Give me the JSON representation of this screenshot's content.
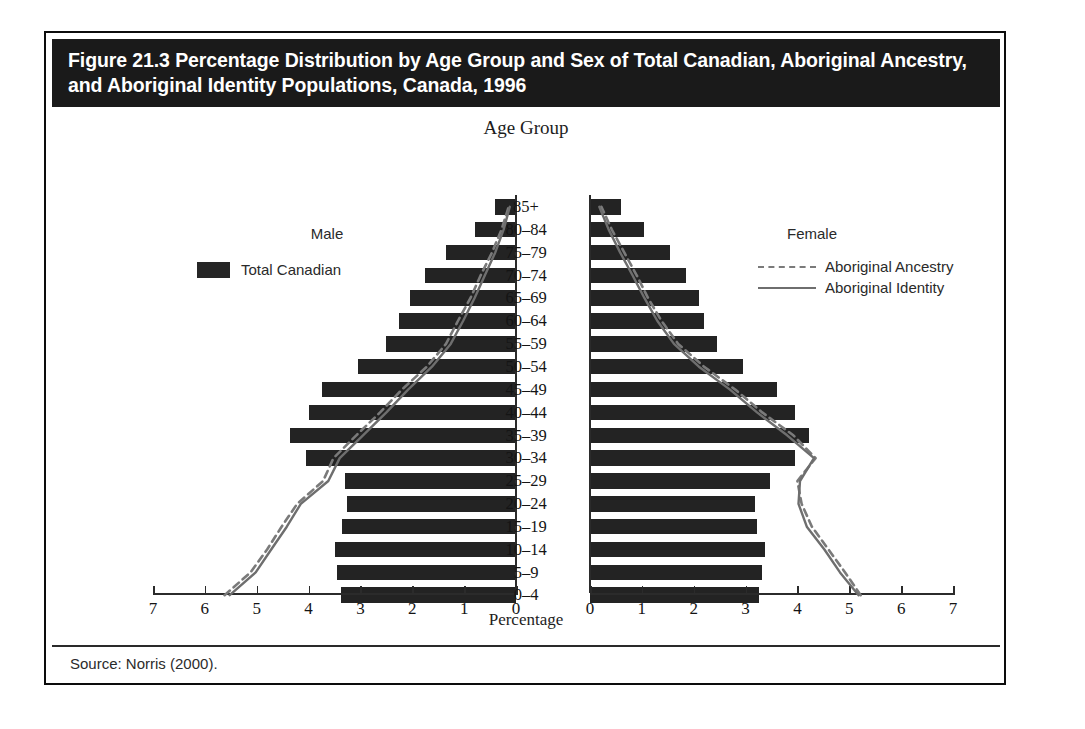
{
  "figure": {
    "title": "Figure 21.3 Percentage Distribution by Age Group and Sex of Total Canadian, Aboriginal Ancestry, and Aboriginal Identity Populations, Canada, 1996",
    "source": "Source: Norris (2000).",
    "male_heading": "Male",
    "female_heading": "Female",
    "legend_left_label": "Total Canadian",
    "legend_right": [
      {
        "label": "Aboriginal Ancestry",
        "style": "dashed"
      },
      {
        "label": "Aboriginal Identity",
        "style": "solid"
      }
    ],
    "colors": {
      "bar": "#232323",
      "banner": "#1a1a1a",
      "banner_text": "#ffffff",
      "ancestry_line": "#7a7a7a",
      "identity_line": "#6e6e6e",
      "axis": "#2b2b2b",
      "background": "#ffffff"
    }
  },
  "chart_data": {
    "type": "bar",
    "subtype": "population-pyramid",
    "title": "Figure 21.3 Percentage Distribution by Age Group and Sex of Total Canadian, Aboriginal Ancestry, and Aboriginal Identity Populations, Canada, 1996",
    "xlabel": "Percentage",
    "ylabel": "Age Group",
    "xlim": [
      0,
      7
    ],
    "xticks": [
      0,
      1,
      2,
      3,
      4,
      5,
      6,
      7
    ],
    "xtick_labels_left": [
      "7",
      "6",
      "5",
      "4",
      "3",
      "2",
      "1",
      "0"
    ],
    "xtick_labels_right": [
      "0",
      "1",
      "2",
      "3",
      "4",
      "5",
      "6",
      "7"
    ],
    "grid": false,
    "legend_position": "inside-top-right",
    "categories": [
      "0–4",
      "5–9",
      "10–14",
      "15–19",
      "20–24",
      "25–29",
      "30–34",
      "35–39",
      "40–44",
      "45–49",
      "50–54",
      "55–59",
      "60–64",
      "65–69",
      "70–74",
      "75–79",
      "80–84",
      "85+"
    ],
    "series": [
      {
        "name": "Total Canadian",
        "side": "male",
        "render": "bar",
        "values": [
          3.37,
          3.45,
          3.5,
          3.35,
          3.25,
          3.3,
          4.05,
          4.35,
          4.0,
          3.75,
          3.05,
          2.5,
          2.25,
          2.05,
          1.75,
          1.35,
          0.8,
          0.4
        ]
      },
      {
        "name": "Total Canadian",
        "side": "female",
        "render": "bar",
        "values": [
          3.25,
          3.32,
          3.38,
          3.22,
          3.18,
          3.48,
          3.95,
          4.22,
          3.95,
          3.6,
          2.95,
          2.45,
          2.2,
          2.1,
          1.85,
          1.55,
          1.05,
          0.6
        ]
      },
      {
        "name": "Aboriginal Ancestry",
        "side": "male",
        "render": "line-dashed",
        "values": [
          5.62,
          5.12,
          4.8,
          4.52,
          4.22,
          3.72,
          3.52,
          3.08,
          2.62,
          2.2,
          1.72,
          1.35,
          1.12,
          0.88,
          0.68,
          0.46,
          0.28,
          0.14
        ]
      },
      {
        "name": "Aboriginal Identity",
        "side": "male",
        "render": "line-solid",
        "values": [
          5.52,
          5.02,
          4.72,
          4.42,
          4.15,
          3.62,
          3.4,
          2.95,
          2.5,
          2.08,
          1.62,
          1.26,
          1.02,
          0.8,
          0.6,
          0.4,
          0.24,
          0.12
        ]
      },
      {
        "name": "Aboriginal Ancestry",
        "side": "female",
        "render": "line-dashed",
        "values": [
          5.22,
          4.92,
          4.6,
          4.28,
          4.08,
          4.0,
          4.35,
          3.92,
          3.32,
          2.8,
          2.2,
          1.7,
          1.38,
          1.12,
          0.9,
          0.66,
          0.42,
          0.22
        ]
      },
      {
        "name": "Aboriginal Identity",
        "side": "female",
        "render": "line-solid",
        "values": [
          5.18,
          4.82,
          4.52,
          4.18,
          4.02,
          4.05,
          4.32,
          3.8,
          3.22,
          2.7,
          2.1,
          1.62,
          1.3,
          1.05,
          0.82,
          0.58,
          0.36,
          0.18
        ]
      }
    ]
  }
}
